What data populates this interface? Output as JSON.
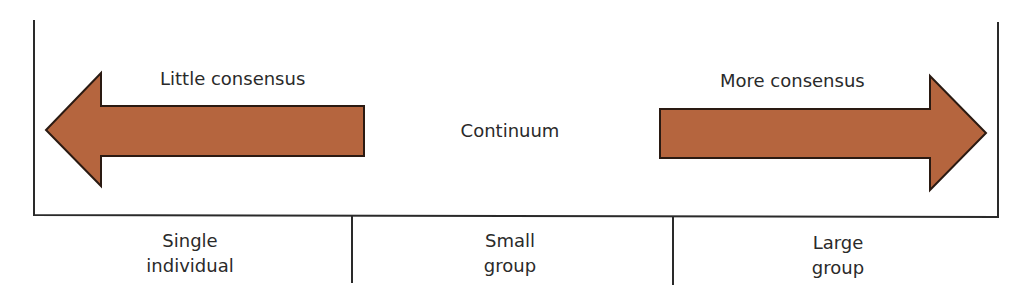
{
  "diagram": {
    "colors": {
      "arrow_fill": "#b5653e",
      "arrow_stroke": "#2a1a12",
      "line": "#2a2a2a"
    },
    "arrows": {
      "left": {
        "label": "Little consensus",
        "direction": "left"
      },
      "right": {
        "label": "More consensus",
        "direction": "right"
      }
    },
    "center_label": "Continuum",
    "categories": [
      {
        "line1": "Single",
        "line2": "individual"
      },
      {
        "line1": "Small",
        "line2": "group"
      },
      {
        "line1": "Large",
        "line2": "group"
      }
    ]
  }
}
